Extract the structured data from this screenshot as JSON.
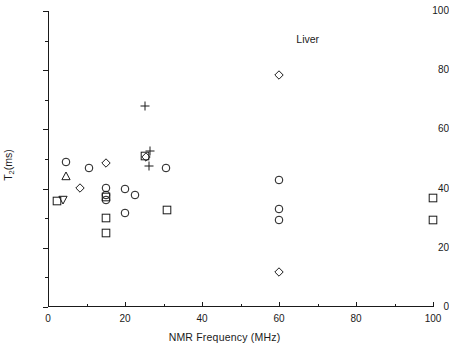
{
  "chart_data": {
    "type": "scatter",
    "title": "",
    "annotation": "Liver",
    "xlabel": "NMR Frequency (MHz)",
    "ylabel": "T2(ms)",
    "ylabel_base": "T",
    "ylabel_sub": "2",
    "ylabel_tail": "(ms)",
    "xlim": [
      0,
      100
    ],
    "ylim": [
      0,
      100
    ],
    "xticks": [
      0,
      20,
      40,
      60,
      80,
      100
    ],
    "yticks": [
      0,
      20,
      40,
      60,
      80,
      100
    ],
    "xticklabels": [
      "0",
      "20",
      "40",
      "60",
      "80",
      "100"
    ],
    "yticklabels": [
      "0",
      "20",
      "40",
      "60",
      "80",
      "100"
    ],
    "xminorticks": [
      10,
      30,
      50,
      70,
      90
    ],
    "yminorticks": [
      10,
      30,
      50,
      70,
      90
    ],
    "grid": false,
    "legend": false,
    "marker_shapes": [
      "circle",
      "square",
      "diamond",
      "triangle-up",
      "triangle-down",
      "plus"
    ],
    "points": [
      {
        "x": 2.3,
        "y": 35.8,
        "marker": "square"
      },
      {
        "x": 4.0,
        "y": 36.2,
        "marker": "triangle-down"
      },
      {
        "x": 4.8,
        "y": 48.9,
        "marker": "circle"
      },
      {
        "x": 4.8,
        "y": 44.2,
        "marker": "triangle-up"
      },
      {
        "x": 8.2,
        "y": 40.1,
        "marker": "diamond"
      },
      {
        "x": 10.7,
        "y": 46.8,
        "marker": "circle"
      },
      {
        "x": 15.0,
        "y": 48.8,
        "marker": "diamond"
      },
      {
        "x": 15.0,
        "y": 40.2,
        "marker": "circle"
      },
      {
        "x": 15.0,
        "y": 37.7,
        "marker": "circle"
      },
      {
        "x": 15.0,
        "y": 37.0,
        "marker": "square"
      },
      {
        "x": 15.0,
        "y": 36.3,
        "marker": "circle"
      },
      {
        "x": 15.0,
        "y": 30.0,
        "marker": "square"
      },
      {
        "x": 15.0,
        "y": 24.9,
        "marker": "square"
      },
      {
        "x": 20.0,
        "y": 39.8,
        "marker": "circle"
      },
      {
        "x": 20.0,
        "y": 31.6,
        "marker": "circle"
      },
      {
        "x": 22.5,
        "y": 37.8,
        "marker": "circle"
      },
      {
        "x": 25.3,
        "y": 68.0,
        "marker": "plus"
      },
      {
        "x": 25.3,
        "y": 51.0,
        "marker": "square"
      },
      {
        "x": 25.5,
        "y": 50.6,
        "marker": "diamond"
      },
      {
        "x": 26.4,
        "y": 52.6,
        "marker": "plus"
      },
      {
        "x": 26.2,
        "y": 47.7,
        "marker": "plus"
      },
      {
        "x": 30.6,
        "y": 46.9,
        "marker": "circle"
      },
      {
        "x": 31.0,
        "y": 32.8,
        "marker": "square"
      },
      {
        "x": 60.0,
        "y": 78.3,
        "marker": "diamond"
      },
      {
        "x": 60.0,
        "y": 42.9,
        "marker": "circle"
      },
      {
        "x": 60.0,
        "y": 33.0,
        "marker": "circle"
      },
      {
        "x": 60.0,
        "y": 29.4,
        "marker": "circle"
      },
      {
        "x": 60.0,
        "y": 11.8,
        "marker": "diamond"
      },
      {
        "x": 100.0,
        "y": 36.9,
        "marker": "square"
      },
      {
        "x": 100.0,
        "y": 29.4,
        "marker": "square"
      }
    ],
    "annotation_pos": {
      "x": 64.5,
      "y": 90.5
    }
  }
}
